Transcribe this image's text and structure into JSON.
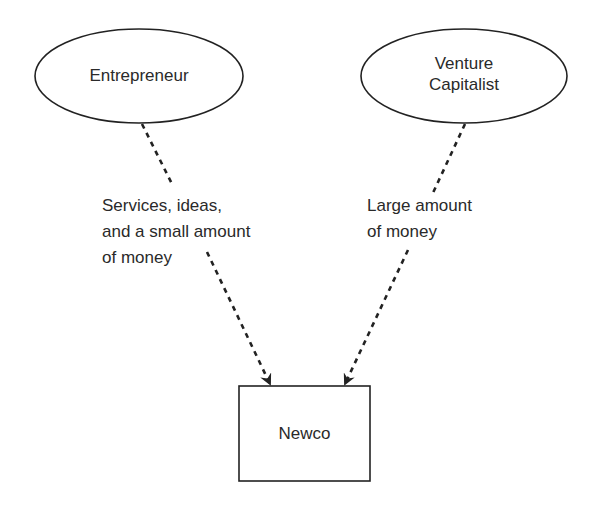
{
  "diagram": {
    "nodes": [
      {
        "id": "entrepreneur",
        "shape": "ellipse",
        "lines": [
          "Entrepreneur"
        ]
      },
      {
        "id": "venture-capitalist",
        "shape": "ellipse",
        "lines": [
          "Venture",
          "Capitalist"
        ]
      },
      {
        "id": "newco",
        "shape": "rectangle",
        "lines": [
          "Newco"
        ]
      }
    ],
    "edges": [
      {
        "from": "entrepreneur",
        "to": "newco",
        "style": "dashed-arrow",
        "label_lines": [
          "Services, ideas,",
          "and a small amount",
          "of money"
        ]
      },
      {
        "from": "venture-capitalist",
        "to": "newco",
        "style": "dashed-arrow",
        "label_lines": [
          "Large amount",
          "of money"
        ]
      }
    ],
    "colors": {
      "stroke": "#222222",
      "text": "#2a2a2a",
      "background": "#ffffff"
    }
  }
}
